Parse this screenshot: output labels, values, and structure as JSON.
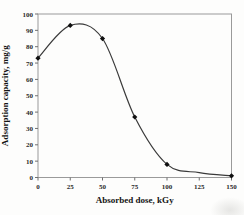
{
  "figure": {
    "background": "#fdfdfc"
  },
  "chart_data": {
    "type": "line",
    "title": "",
    "xlabel": "Absorbed dose, kGy",
    "ylabel": "Adsorption capacity, mg/g",
    "x": [
      0,
      25,
      50,
      75,
      100,
      150
    ],
    "y": [
      73,
      93,
      85,
      37,
      8,
      1
    ],
    "series": [
      {
        "name": "adsorption-capacity",
        "marker": "diamond",
        "points": [
          {
            "x": 0,
            "y": 73
          },
          {
            "x": 25,
            "y": 93
          },
          {
            "x": 50,
            "y": 85
          },
          {
            "x": 75,
            "y": 37
          },
          {
            "x": 100,
            "y": 8
          },
          {
            "x": 150,
            "y": 1
          }
        ],
        "curve_through": {
          "x": [
            0,
            25,
            50,
            75,
            100,
            125,
            150
          ],
          "y": [
            73,
            93,
            85,
            37,
            8,
            3,
            1
          ]
        }
      }
    ],
    "xlim": [
      0,
      150
    ],
    "ylim": [
      0,
      100
    ],
    "xticks": [
      0,
      25,
      50,
      75,
      100,
      125,
      150
    ],
    "yticks": [
      0,
      10,
      20,
      30,
      40,
      50,
      60,
      70,
      80,
      90,
      100
    ],
    "grid": false,
    "legend": false,
    "frame": "box",
    "colors": {
      "line": "#3a3a3a",
      "marker": "#101010",
      "frame": "#9a9a9a",
      "tick": "#6f6f6f",
      "text": "#141414"
    },
    "layout_px": {
      "plot_left": 38,
      "plot_top": 14,
      "plot_right": 231.5,
      "plot_bottom": 177.5
    }
  }
}
